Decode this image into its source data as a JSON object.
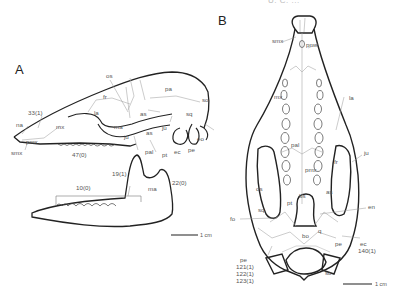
{
  "header": {
    "running_title": "U. C. ..."
  },
  "panels": {
    "A": {
      "label": "A",
      "view": "lateral skull and mandible",
      "bone_labels": {
        "os": "os",
        "fr": "fr",
        "pa": "pa",
        "la": "la",
        "mx": "mx",
        "ma": "ma",
        "ju": "ju",
        "as": "as",
        "as2": "as",
        "sq": "sq",
        "so": "so",
        "eo": "eo",
        "na": "na",
        "pmx": "pmx",
        "smx": "smx",
        "pal": "pal",
        "pt": "pt",
        "ec": "ec",
        "pe": "pe",
        "ma_mandible": "ma"
      },
      "characters": {
        "c33": "33(1)",
        "c47": "47(0)",
        "c19": "19(1)",
        "c10": "10(0)",
        "c22": "22(0)"
      },
      "scale_bar": "1 cm"
    },
    "B": {
      "label": "B",
      "view": "ventral skull",
      "bone_labels": {
        "smx": "smx",
        "pmx": "pmx",
        "mx": "mx",
        "la": "la",
        "pal": "pal",
        "ju": "ju",
        "fr": "fr",
        "os": "os",
        "as": "as",
        "sq": "sq",
        "pt": "pt",
        "bs": "bs",
        "fo": "fo",
        "en": "en",
        "bo": "bo",
        "ec": "ec",
        "pe": "pe",
        "so": "so",
        "q": "q"
      },
      "characters": {
        "c140": "140(1)",
        "c121": "121(1)",
        "c122": "122(1)",
        "c123": "123(1)"
      },
      "scale_bar": "1 cm"
    }
  }
}
